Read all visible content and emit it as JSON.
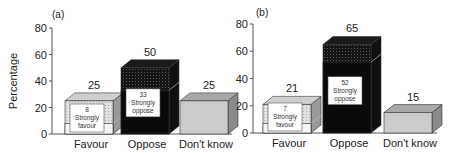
{
  "chart_data": [
    {
      "type": "bar",
      "panel_label": "(a)",
      "ylabel": "Percentage",
      "ylim": [
        0,
        80
      ],
      "yticks": [
        0,
        20,
        40,
        60,
        80
      ],
      "categories": [
        "Favour",
        "Oppose",
        "Don't know"
      ],
      "values": [
        25,
        50,
        25
      ],
      "strongly": [
        {
          "category": "Favour",
          "value": 8,
          "label": "Strongly favour"
        },
        {
          "category": "Oppose",
          "value": 33,
          "label": "Strongly oppose"
        }
      ],
      "grid": false,
      "style": "3d-stacked"
    },
    {
      "type": "bar",
      "panel_label": "(b)",
      "ylabel": "",
      "ylim": [
        0,
        80
      ],
      "yticks": [
        0,
        20,
        40,
        60,
        80
      ],
      "categories": [
        "Favour",
        "Oppose",
        "Don't know"
      ],
      "values": [
        21,
        65,
        15
      ],
      "strongly": [
        {
          "category": "Favour",
          "value": 7,
          "label": "Strongly favour"
        },
        {
          "category": "Oppose",
          "value": 52,
          "label": "Strongly oppose"
        }
      ],
      "grid": false,
      "style": "3d-stacked"
    }
  ],
  "colors": {
    "favour_front": "#f4f4f4",
    "favour_top": "#cfcfcf",
    "favour_side": "#9a9a9a",
    "oppose_front": "#0a0a0a",
    "oppose_upper": "#2a2a2a",
    "dk_front": "#cbcbcb",
    "dk_top": "#a8a8a8",
    "dk_side": "#8a8a8a",
    "axis": "#555555"
  }
}
